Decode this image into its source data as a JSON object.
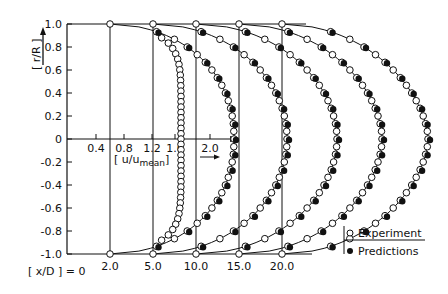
{
  "chart_data": {
    "type": "line",
    "title": "",
    "ylabel": "[ r/R ]",
    "xlabel": "[ u/u_mean ]",
    "x_ticks": [
      "0.4",
      "0.8",
      "1.2",
      "1.6",
      "2.0"
    ],
    "y_ticks": [
      "1.0",
      "0.8",
      "0.6",
      "0.4",
      "0.2",
      "0",
      "-0.2",
      "-0.4",
      "-0.6",
      "-0.8",
      "-1.0"
    ],
    "ylim": [
      -1.0,
      1.0
    ],
    "station_label": "[x/D] = 0",
    "stations": [
      "2.0",
      "5.0",
      "10.0",
      "15.0",
      "20.0"
    ],
    "legend": [
      {
        "marker": "open-circle",
        "label": "Experiment"
      },
      {
        "marker": "filled-circle",
        "label": "Predictions"
      }
    ],
    "series": [
      {
        "name": "x/D=0",
        "peak_u": 1.65,
        "has_predictions": false
      },
      {
        "name": "x/D=2.0",
        "peak_u": 1.75,
        "has_predictions": true
      },
      {
        "name": "x/D=5.0",
        "peak_u": 1.7,
        "has_predictions": true
      },
      {
        "name": "x/D=10.0",
        "peak_u": 1.65,
        "has_predictions": true
      },
      {
        "name": "x/D=15.0",
        "peak_u": 1.6,
        "has_predictions": true
      },
      {
        "name": "x/D=20.0",
        "peak_u": 1.55,
        "has_predictions": true
      }
    ]
  },
  "labels": {
    "yaxis": "[ r/R ]",
    "xaxis_main": "[ u/u",
    "xaxis_sub": "mean",
    "xaxis_close": "]",
    "station": "[ x/D ] = 0",
    "legend_exp": "Experiment",
    "legend_pred": "Predictions"
  }
}
